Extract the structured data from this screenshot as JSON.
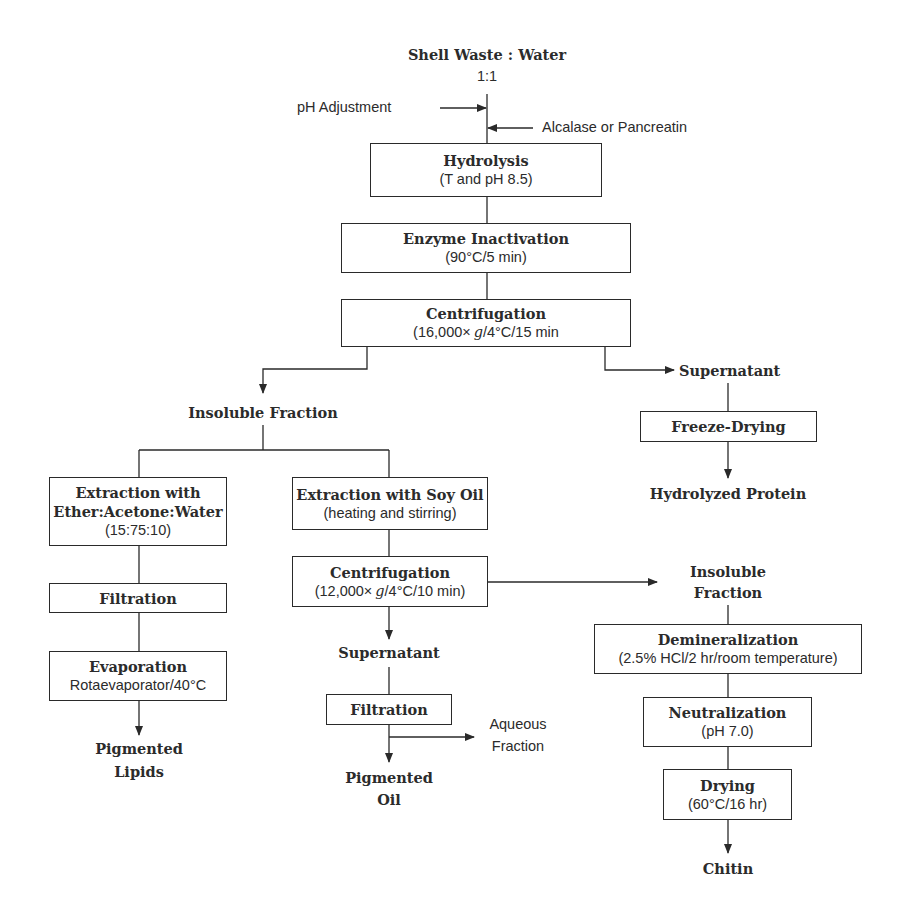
{
  "diagram": {
    "type": "process-flowchart",
    "start": {
      "title": "Shell Waste : Water",
      "ratio": "1:1"
    },
    "inputs": {
      "ph_adjustment": "pH Adjustment",
      "enzyme": "Alcalase or Pancreatin"
    },
    "main_steps": [
      {
        "title": "Hydrolysis",
        "detail": "(T and pH 8.5)"
      },
      {
        "title": "Enzyme Inactivation",
        "detail": "(90°C/5 min)"
      },
      {
        "title": "Centrifugation",
        "detail_pre": "(16,000× ",
        "detail_g": "g",
        "detail_post": "/4°C/15 min"
      }
    ],
    "supernatant_branch": {
      "label": "Supernatant",
      "step": "Freeze-Drying",
      "product": "Hydrolyzed Protein"
    },
    "insoluble_branch": {
      "label": "Insoluble Fraction",
      "solvent_path": {
        "extraction": {
          "line1": "Extraction with",
          "line2": "Ether:Acetone:Water",
          "detail": "(15:75:10)"
        },
        "filtration": "Filtration",
        "evaporation": {
          "title": "Evaporation",
          "detail": "Rotaevaporator/40°C"
        },
        "product_line1": "Pigmented",
        "product_line2": "Lipids"
      },
      "oil_path": {
        "extraction": {
          "title": "Extraction with Soy Oil",
          "detail": "(heating and stirring)"
        },
        "centrifugation": {
          "title": "Centrifugation",
          "detail_pre": "(12,000× ",
          "detail_g": "g",
          "detail_post": "/4°C/10 min)"
        },
        "supernatant": "Supernatant",
        "filtration": "Filtration",
        "side_output_line1": "Aqueous",
        "side_output_line2": "Fraction",
        "product_line1": "Pigmented",
        "product_line2": "Oil"
      },
      "chitin_path": {
        "label_line1": "Insoluble",
        "label_line2": "Fraction",
        "demineralization": {
          "title": "Demineralization",
          "detail": "(2.5% HCl/2 hr/room temperature)"
        },
        "neutralization": {
          "title": "Neutralization",
          "detail": "(pH 7.0)"
        },
        "drying": {
          "title": "Drying",
          "detail": "(60°C/16 hr)"
        },
        "product": "Chitin"
      }
    },
    "colors": {
      "line": "#2a2a2a",
      "text": "#2b2b2b",
      "background": "#ffffff"
    }
  }
}
